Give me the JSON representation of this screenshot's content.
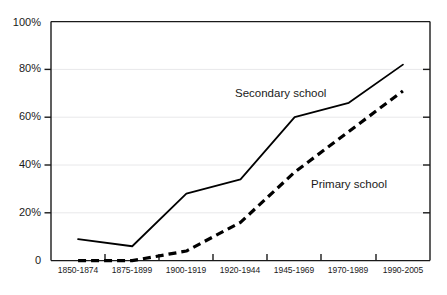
{
  "chart_data": {
    "type": "line",
    "title": "",
    "subtitle": "",
    "xlabel": "",
    "ylabel": "",
    "ylim": [
      0,
      100
    ],
    "yticks": [
      0,
      20,
      40,
      60,
      80,
      100
    ],
    "ytick_labels": [
      "0",
      "20%",
      "40%",
      "60%",
      "80%",
      "100%"
    ],
    "grid": true,
    "grid_axis": "y",
    "legend_position": "inline-annotation",
    "categories": [
      "1850-1874",
      "1875-1899",
      "1900-1919",
      "1920-1944",
      "1945-1969",
      "1970-1989",
      "1990-2005"
    ],
    "series": [
      {
        "name": "Secondary school",
        "style": "solid",
        "color": "#000000",
        "values": [
          9,
          6,
          28,
          34,
          60,
          66,
          82
        ]
      },
      {
        "name": "Primary school",
        "style": "dashed",
        "color": "#000000",
        "values": [
          0,
          0,
          4,
          16,
          37,
          54,
          71
        ]
      }
    ],
    "annotations": [
      {
        "text": "Secondary school",
        "series": "Secondary school"
      },
      {
        "text": "Primary school",
        "series": "Primary school"
      }
    ]
  },
  "axis": {
    "y_labels": [
      "100%",
      "80%",
      "60%",
      "40%",
      "20%",
      "0"
    ],
    "x_labels": [
      "1850-1874",
      "1875-1899",
      "1900-1919",
      "1920-1944",
      "1945-1969",
      "1970-1989",
      "1990-2005"
    ]
  },
  "labels": {
    "secondary": "Secondary school",
    "primary": "Primary school"
  },
  "colors": {
    "axis": "#1a1a1a",
    "grid": "#e8e8ea",
    "line": "#000000",
    "background": "#ffffff"
  }
}
